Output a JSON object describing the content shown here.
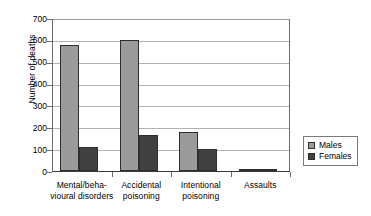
{
  "chart_data": {
    "type": "bar",
    "title": "",
    "xlabel": "",
    "ylabel": "Number of deaths",
    "ylim": [
      0,
      700
    ],
    "yticks": [
      0,
      100,
      200,
      300,
      400,
      500,
      600,
      700
    ],
    "ytick_labels": [
      "0",
      "100",
      "200",
      "300",
      "400",
      "500",
      "600",
      "700"
    ],
    "grid": true,
    "legend_position": "right",
    "categories": [
      "Mental/beha-\nvioural disorders",
      "Accidental\npoisoning",
      "Intentional\npoisoning",
      "Assaults"
    ],
    "category_lines": [
      [
        "Mental/beha-",
        "vioural disorders"
      ],
      [
        "Accidental",
        "poisoning"
      ],
      [
        "Intentional",
        "poisoning"
      ],
      [
        "Assaults",
        ""
      ]
    ],
    "series": [
      {
        "name": "Males",
        "color": "#9b9b9b",
        "values": [
          578,
          598,
          180,
          8
        ]
      },
      {
        "name": "Females",
        "color": "#414141",
        "values": [
          108,
          165,
          102,
          4
        ]
      }
    ]
  },
  "legend": {
    "items": [
      {
        "label": "Males",
        "color": "#9b9b9b"
      },
      {
        "label": "Females",
        "color": "#414141"
      }
    ]
  },
  "caption": {
    "text": ""
  }
}
